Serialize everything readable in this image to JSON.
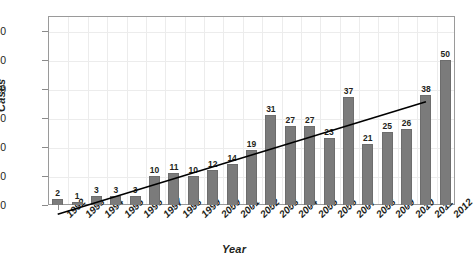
{
  "chart_data": {
    "type": "bar",
    "title": "",
    "xlabel": "Year",
    "ylabel": "Cases",
    "categories": [
      "1992",
      "1993",
      "1994",
      "1995",
      "1996",
      "1997",
      "1998",
      "1999",
      "2000",
      "2001",
      "2002",
      "2003",
      "2004",
      "2005",
      "2006",
      "2007",
      "2008",
      "2009",
      "2010",
      "2011",
      "2012"
    ],
    "values": [
      2,
      1,
      3,
      3,
      3,
      10,
      11,
      10,
      12,
      14,
      19,
      31,
      27,
      27,
      23,
      37,
      21,
      25,
      26,
      38,
      50
    ],
    "series": [
      {
        "name": "Cases",
        "values": [
          2,
          1,
          3,
          3,
          3,
          10,
          11,
          10,
          12,
          14,
          19,
          31,
          27,
          27,
          23,
          37,
          21,
          25,
          26,
          38,
          50
        ]
      }
    ],
    "ylim": [
      0,
      65
    ],
    "y_ticks": [
      0,
      10,
      20,
      30,
      40,
      50,
      60
    ],
    "y_tick_labels": [
      "0",
      "10",
      "20",
      "30",
      "40",
      "50",
      "60"
    ],
    "grid": true,
    "legend": "none",
    "bar_color": "#7b7b7b",
    "trendline": {
      "type": "linear",
      "visible": true,
      "color": "#000000",
      "start_value": -3.2,
      "end_value": 35.5
    },
    "data_labels": [
      "2",
      "1",
      "3",
      "3",
      "3",
      "10",
      "11",
      "10",
      "12",
      "14",
      "19",
      "31",
      "27",
      "27",
      "23",
      "37",
      "21",
      "25",
      "26",
      "38",
      "50"
    ]
  }
}
